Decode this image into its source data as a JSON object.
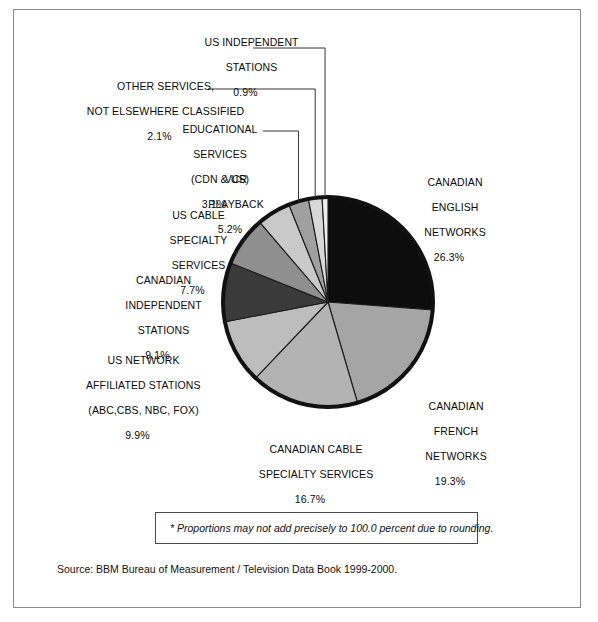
{
  "frame": {
    "border_color": "#8a8a8a"
  },
  "chart_data": {
    "type": "pie",
    "title": "",
    "subtitle": "",
    "xlabel": "",
    "ylabel": "",
    "legend_position": "callout-labels",
    "grid": false,
    "total_label": "100.0 percent",
    "start_angle_deg": 0,
    "direction": "clockwise",
    "center": {
      "x": 328,
      "y": 302
    },
    "radius": 105,
    "outline_color": "#111111",
    "outline_width": 4,
    "categories": [
      "CANADIAN ENGLISH NETWORKS",
      "CANADIAN FRENCH NETWORKS",
      "CANADIAN CABLE SPECIALTY SERVICES",
      "US NETWORK AFFILIATED STATIONS (ABC,CBS, NBC, FOX)",
      "CANADIAN INDEPENDENT STATIONS",
      "US CABLE SPECIALTY SERVICES",
      "VCR PLAYBACK",
      "EDUCATIONAL SERVICES (CDN & US)",
      "OTHER SERVICES, NOT ELSEWHERE CLASSIFIED",
      "US INDEPENDENT STATIONS"
    ],
    "values": [
      26.3,
      19.3,
      16.7,
      9.9,
      9.1,
      7.7,
      5.2,
      3.1,
      2.1,
      0.9
    ],
    "value_labels": [
      "26.3%",
      "19.3%",
      "16.7%",
      "9.9%",
      "9.1%",
      "7.7%",
      "5.2%",
      "3.1%",
      "2.1%",
      "0.9%"
    ],
    "colors": [
      "#0d0d0d",
      "#a5a5a5",
      "#b3b3b3",
      "#bdbdbd",
      "#3a3a3a",
      "#8f8f8f",
      "#c9c9c9",
      "#a0a0a0",
      "#d8d8d8",
      "#ededed"
    ]
  },
  "callouts": {
    "canadian_english": {
      "line1": "CANADIAN",
      "line2": "ENGLISH",
      "line3": "NETWORKS",
      "pct": "26.3%"
    },
    "canadian_french": {
      "line1": "CANADIAN",
      "line2": "FRENCH",
      "line3": "NETWORKS",
      "pct": "19.3%"
    },
    "canadian_cable": {
      "line1": "CANADIAN CABLE",
      "line2": "SPECIALTY SERVICES",
      "pct": "16.7%"
    },
    "us_network_affiliated": {
      "line1": "US NETWORK",
      "line2": "AFFILIATED STATIONS",
      "line3": "(ABC,CBS, NBC, FOX)",
      "pct": "9.9%"
    },
    "canadian_independent": {
      "line1": "CANADIAN",
      "line2": "INDEPENDENT",
      "line3": "STATIONS",
      "pct": "9.1%"
    },
    "us_cable_specialty": {
      "line1": "US CABLE",
      "line2": "SPECIALTY",
      "line3": "SERVICES",
      "pct": "7.7%"
    },
    "vcr_playback": {
      "line1": "VCR",
      "line2": "PLAYBACK",
      "pct": "5.2%"
    },
    "educational_services": {
      "line1": "EDUCATIONAL",
      "line2": "SERVICES",
      "line3": "(CDN & US)",
      "pct": "3.1%"
    },
    "other_services": {
      "line1": "OTHER SERVICES,",
      "line2": "NOT ELSEWHERE CLASSIFIED",
      "pct": "2.1%"
    },
    "us_independent": {
      "line1": "US INDEPENDENT",
      "line2": "STATIONS",
      "pct": "0.9%"
    }
  },
  "footnote": {
    "text": "*  Proportions may not add precisely to 100.0 percent due to rounding."
  },
  "source": {
    "text": "Source: BBM Bureau of Measurement / Television Data Book 1999-2000."
  }
}
